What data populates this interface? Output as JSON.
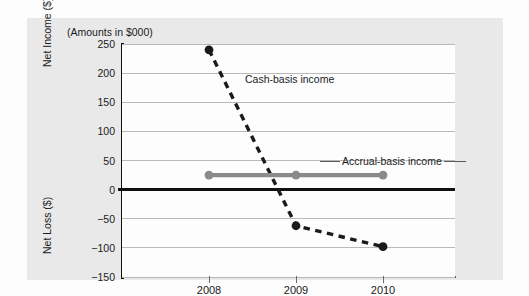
{
  "figure": {
    "caption": "(Amounts in $000)",
    "y_axis_title_upper": "Net Income ($)",
    "y_axis_title_lower": "Net Loss ($)"
  },
  "chart_data": {
    "type": "line",
    "title": "",
    "subtitle": "(Amounts in $000)",
    "xlabel": "Year",
    "ylabel": "Net Income ($) / Net Loss ($)",
    "categories": [
      "2008",
      "2009",
      "2010"
    ],
    "x": [
      2008,
      2009,
      2010
    ],
    "xtick_labels": [
      "2008",
      "2009",
      "2010"
    ],
    "ytick_labels": [
      "250",
      "200",
      "150",
      "100",
      "50",
      "0",
      "-50",
      "-100",
      "-150"
    ],
    "ytick_values": [
      250,
      200,
      150,
      100,
      50,
      0,
      -50,
      -100,
      -150
    ],
    "ylim": [
      -150,
      250
    ],
    "ystep": 50,
    "grid": true,
    "zero_line": 0,
    "legend_position": "inline-annotations",
    "series": [
      {
        "name": "Cash-basis income",
        "values": [
          240,
          -62,
          -98
        ],
        "color": "#1a1a1a",
        "style": "dashed",
        "marker": "circle",
        "annotation": "Cash-basis income"
      },
      {
        "name": "Accrual-basis income",
        "values": [
          25,
          25,
          25
        ],
        "color": "#8a8a8a",
        "style": "solid",
        "marker": "circle",
        "annotation": "Accrual-basis income"
      }
    ],
    "annotations": [
      {
        "text": "Cash-basis income",
        "series": "Cash-basis income"
      },
      {
        "text": "Accrual-basis income",
        "series": "Accrual-basis income"
      }
    ]
  }
}
